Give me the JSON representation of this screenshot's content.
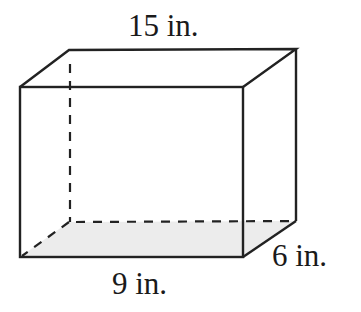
{
  "diagram": {
    "type": "rectangular-prism",
    "labels": {
      "top_length": "15 in.",
      "front_width": "9 in.",
      "depth": "6 in."
    },
    "colors": {
      "stroke": "#222222",
      "base_fill": "#ececec",
      "background": "#ffffff"
    }
  }
}
